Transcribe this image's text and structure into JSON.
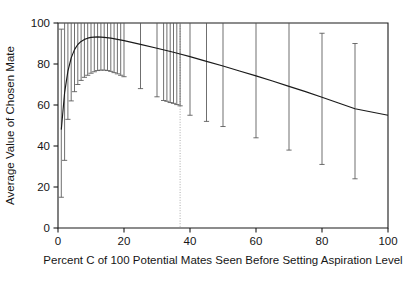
{
  "chart_data": {
    "type": "line",
    "title": "",
    "subtitle": "",
    "xlabel": "Percent C of 100 Potential Mates Seen Before Setting Aspiration Level",
    "ylabel": "Average Value of Chosen Mate",
    "xlim": [
      0,
      100
    ],
    "ylim": [
      0,
      100
    ],
    "xticks": [
      0,
      20,
      40,
      60,
      80,
      100
    ],
    "xtick_labels": [
      "0",
      "20",
      "40",
      "60",
      "80",
      "100"
    ],
    "yticks": [
      0,
      20,
      40,
      60,
      80,
      100
    ],
    "ytick_labels": [
      "0",
      "20",
      "40",
      "60",
      "80",
      "100"
    ],
    "grid": false,
    "legend": "none",
    "series": [
      {
        "name": "Average value of chosen mate",
        "type": "line",
        "x": [
          1,
          2,
          3,
          4,
          5,
          6,
          7,
          8,
          9,
          10,
          12,
          14,
          16,
          18,
          20,
          25,
          30,
          35,
          37,
          40,
          45,
          50,
          55,
          60,
          65,
          70,
          75,
          80,
          85,
          90,
          95,
          100
        ],
        "values": [
          48.0,
          66.0,
          76.5,
          83.0,
          87.0,
          89.5,
          91.0,
          92.0,
          92.6,
          93.0,
          93.2,
          93.0,
          92.6,
          92.0,
          91.4,
          89.6,
          87.7,
          85.7,
          84.9,
          83.6,
          81.3,
          79.0,
          76.6,
          74.2,
          71.7,
          69.1,
          66.5,
          63.8,
          61.0,
          58.2,
          56.6,
          55.0
        ]
      }
    ],
    "error_bars": {
      "description": "Vertical range bars (standard deviation) at selected C values; many upper ends clipped at the axis maximum of 100",
      "x": [
        1,
        2,
        3,
        4,
        5,
        6,
        7,
        8,
        9,
        10,
        11,
        12,
        13,
        14,
        15,
        16,
        17,
        18,
        19,
        20,
        25,
        30,
        32,
        33,
        34,
        35,
        36,
        37,
        40,
        45,
        50,
        60,
        70,
        80,
        90
      ],
      "low": [
        15.0,
        33.0,
        53.0,
        62.0,
        66.5,
        70.0,
        72.0,
        73.5,
        74.5,
        75.5,
        76.2,
        76.8,
        77.0,
        77.0,
        76.8,
        76.4,
        75.8,
        75.2,
        74.5,
        73.8,
        68.0,
        64.0,
        62.2,
        61.8,
        61.2,
        60.8,
        60.2,
        59.6,
        55.0,
        52.0,
        49.5,
        44.0,
        38.0,
        31.0,
        24.0
      ],
      "high": [
        97.0,
        100.0,
        100.0,
        100.0,
        100.0,
        100.0,
        100.0,
        100.0,
        100.0,
        100.0,
        100.0,
        100.0,
        100.0,
        100.0,
        100.0,
        100.0,
        100.0,
        100.0,
        100.0,
        100.0,
        100.0,
        100.0,
        100.0,
        100.0,
        100.0,
        100.0,
        100.0,
        100.0,
        100.0,
        100.0,
        100.0,
        100.0,
        100.0,
        95.0,
        90.0
      ],
      "clipped_at_top": true
    },
    "reference_lines": [
      {
        "name": "optimal-C-marker",
        "orientation": "vertical",
        "x": 37,
        "style": "dotted",
        "label": ""
      }
    ],
    "colors": {
      "curve": "#1a1a1a",
      "error_bar": "#555555",
      "axis": "#1a1a1a",
      "reference_line": "#aaaaaa",
      "background": "#ffffff"
    }
  }
}
